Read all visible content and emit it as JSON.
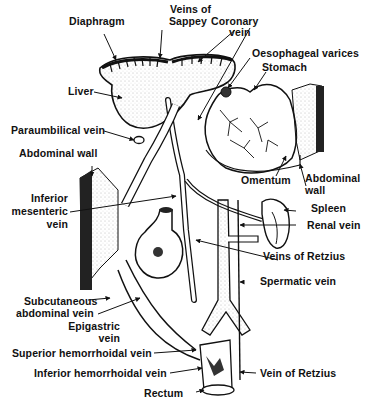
{
  "diagram": {
    "colors": {
      "ink": "#111111",
      "background": "#ffffff",
      "stipple": "#9a9a9a"
    },
    "labels": {
      "diaphragm": "Diaphragm",
      "veins_of_sappey_1": "Veins of",
      "veins_of_sappey_2": "Sappey",
      "coronary_vein_1": "Coronary",
      "coronary_vein_2": "vein",
      "oesophageal_varices": "Oesophageal varices",
      "stomach": "Stomach",
      "liver": "Liver",
      "paraumbilical_vein": "Paraumbilical vein",
      "abdominal_wall_left": "Abdominal wall",
      "inferior_mesenteric_1": "Inferior",
      "inferior_mesenteric_2": "mesenteric",
      "inferior_mesenteric_3": "vein",
      "omentum": "Omentum",
      "abdominal_wall_right_1": "Abdominal",
      "abdominal_wall_right_2": "wall",
      "spleen": "Spleen",
      "renal_vein": "Renal vein",
      "veins_of_retzius": "Veins of Retzius",
      "spermatic_vein": "Spermatic vein",
      "subcutaneous_1": "Subcutaneous",
      "subcutaneous_2": "abdominal vein",
      "epigastric_1": "Epigastric",
      "epigastric_2": "vein",
      "superior_hemorrhoidal": "Superior hemorrhoidal vein",
      "inferior_hemorrhoidal": "Inferior hemorrhoidal vein",
      "vein_of_retzius": "Vein of Retzius",
      "rectum": "Rectum"
    }
  }
}
